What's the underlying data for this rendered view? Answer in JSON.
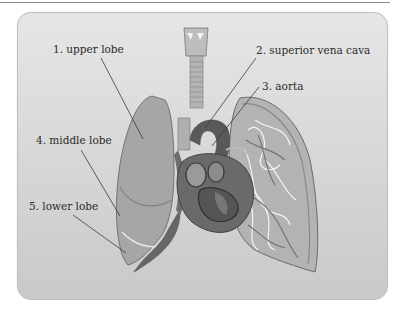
{
  "diagram": {
    "labels": [
      {
        "id": 1,
        "text": "1. upper lobe"
      },
      {
        "id": 2,
        "text": "2. superior vena cava"
      },
      {
        "id": 3,
        "text": "3. aorta"
      },
      {
        "id": 4,
        "text": "4. middle lobe"
      },
      {
        "id": 5,
        "text": "5. lower lobe"
      }
    ],
    "colors": {
      "background": "#d9d9d9",
      "lung_fill": "#a9a9a9",
      "lung_dark": "#6e6e6e",
      "heart": "#5c5c5c",
      "line": "#3a3a3a"
    }
  }
}
